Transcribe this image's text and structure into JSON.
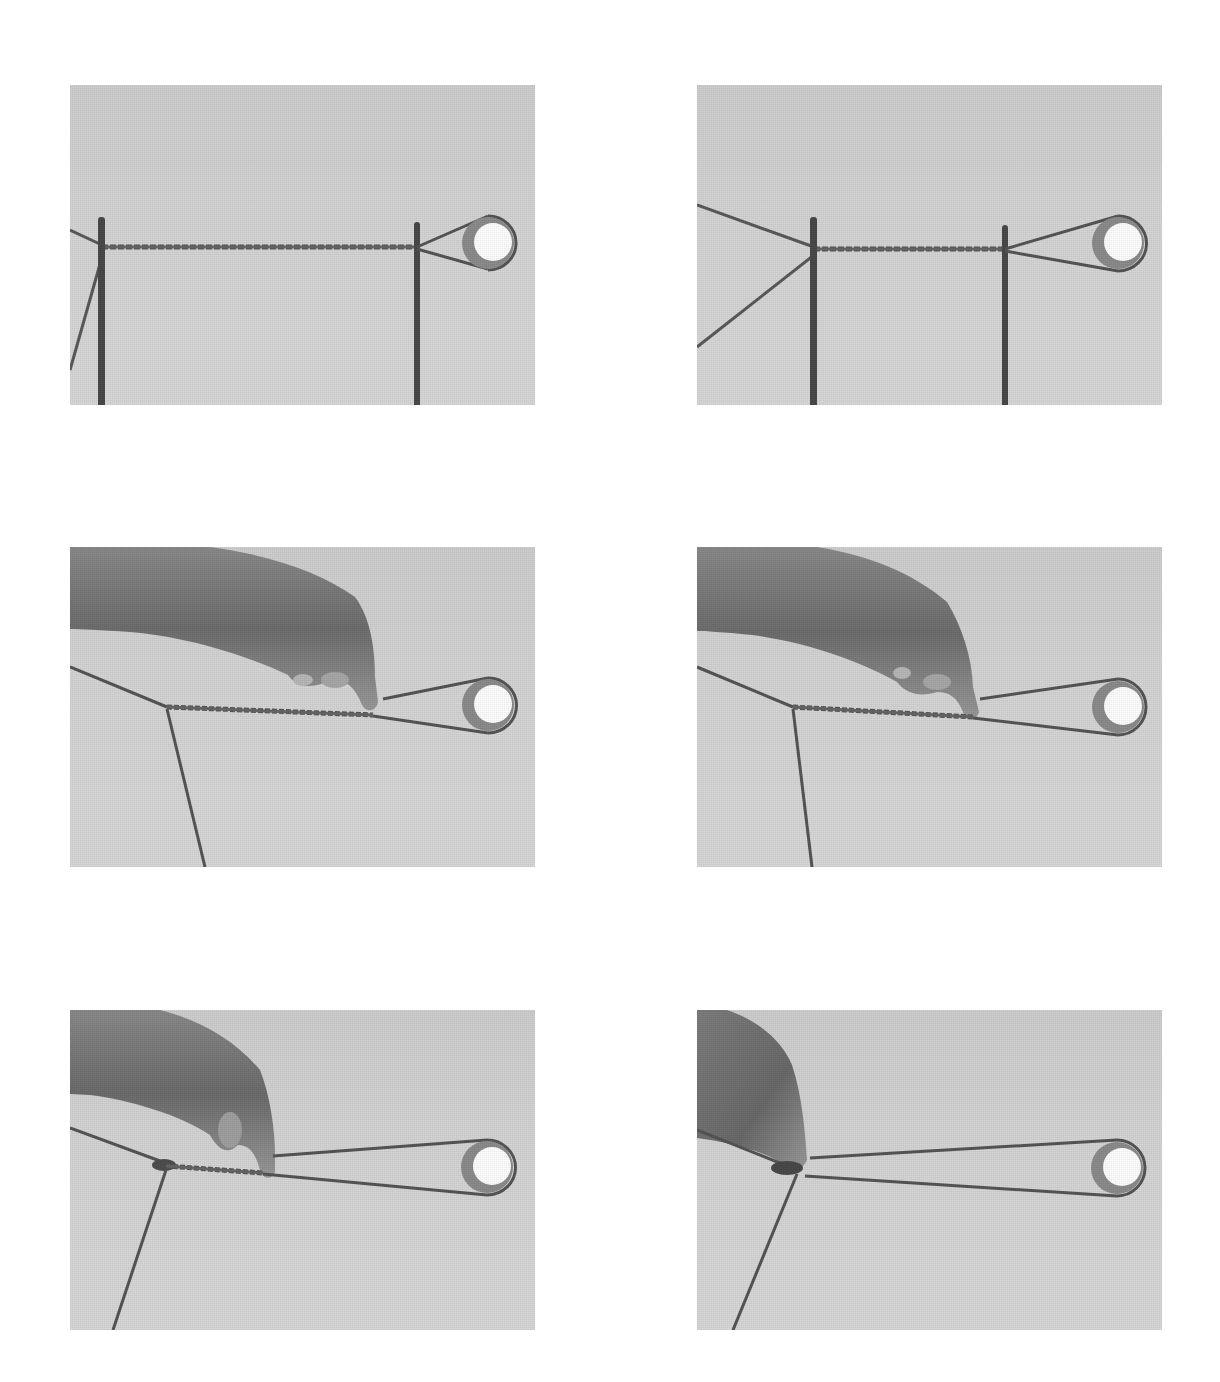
{
  "figure": {
    "layout": {
      "rows": 3,
      "columns": 2
    },
    "colors": {
      "page_background": "#ffffff",
      "photo_background": "#d4d4d4",
      "rope": "#555555",
      "post": "#4a4a4a",
      "pulley_rim": "#8a8a8a",
      "pulley_face": "#ffffff",
      "hand": "#7a7a7a"
    },
    "frames": [
      {
        "step": 1,
        "position": "top-left",
        "content": "Twisted cord stretched horizontally between two vertical posts, loop around pulley at right; two strands exit left post diagonally",
        "has_hand": false
      },
      {
        "step": 2,
        "position": "top-right",
        "content": "Same setup with posts closer together; two strands diverge from left post in a wide V",
        "has_hand": false
      },
      {
        "step": 3,
        "position": "middle-left",
        "content": "Posts removed; hand pinches twisted cord near right end, cord junction with descending strand at left",
        "has_hand": true
      },
      {
        "step": 4,
        "position": "middle-right",
        "content": "Hand slides pinch leftward along twisted section",
        "has_hand": true
      },
      {
        "step": 5,
        "position": "bottom-left",
        "content": "Twisted section shortened, knot forming at junction; loop to pulley lengthened",
        "has_hand": true
      },
      {
        "step": 6,
        "position": "bottom-right",
        "content": "Hand pinches at junction knot; long open loop extends to pulley",
        "has_hand": true
      }
    ]
  }
}
